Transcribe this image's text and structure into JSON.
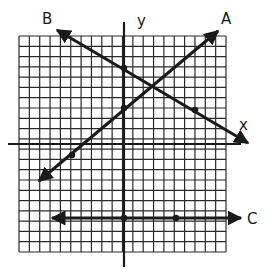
{
  "figure": {
    "type": "coordinate-plane-line-graph",
    "grid": {
      "left": 19,
      "top": 36,
      "right": 226,
      "bottom": 252,
      "cols": 20,
      "rows": 21,
      "color": "#2a2a2a"
    },
    "axes": {
      "x_label": "x",
      "y_label": "y",
      "origin_px": [
        124,
        144
      ],
      "x_axis": {
        "x1": 8,
        "x2": 241,
        "y": 144
      },
      "y_axis": {
        "x": 124,
        "y1": 22,
        "y2": 267
      }
    },
    "lines": [
      {
        "label": "A",
        "from": [
          39,
          181
        ],
        "to": [
          218,
          31
        ],
        "arrows": "both",
        "points": [
          [
            124,
            108
          ],
          [
            72,
            155
          ]
        ],
        "label_pos": [
          221,
          24
        ]
      },
      {
        "label": "B",
        "from": [
          57,
          30
        ],
        "to": [
          248,
          143
        ],
        "arrows": "both",
        "points": [
          [
            124,
            68
          ],
          [
            195,
            110
          ]
        ],
        "label_pos": [
          42,
          24
        ]
      },
      {
        "label": "C",
        "from": [
          52,
          218
        ],
        "to": [
          241,
          218
        ],
        "arrows": "both",
        "points": [
          [
            124,
            218
          ],
          [
            176,
            218
          ]
        ],
        "label_pos": [
          247,
          224
        ]
      }
    ],
    "x_label_pos": [
      239,
      130
    ],
    "y_label_pos": [
      137,
      26
    ],
    "stroke_color": "#1a1a1a"
  }
}
